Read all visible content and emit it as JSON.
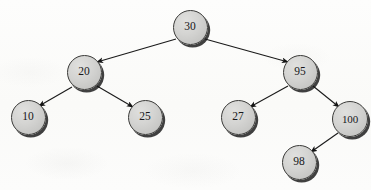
{
  "figure": {
    "clipped_caption_text": "",
    "background_color": "#fbfbf9",
    "node_fill_color": "#d4d4d2",
    "node_stroke_color": "#3a3a38",
    "node_shadow_color": "#121212",
    "edge_color": "#1a1a1a",
    "label_color": "#17171a"
  },
  "tree": {
    "nodes": [
      {
        "id": "n30",
        "label": "30",
        "cx": 190,
        "cy": 27,
        "r": 17.5
      },
      {
        "id": "n20",
        "label": "20",
        "cx": 84,
        "cy": 72,
        "r": 17.5
      },
      {
        "id": "n95",
        "label": "95",
        "cx": 300,
        "cy": 72,
        "r": 17.5
      },
      {
        "id": "n10",
        "label": "10",
        "cx": 28,
        "cy": 117,
        "r": 17.5
      },
      {
        "id": "n25",
        "label": "25",
        "cx": 145,
        "cy": 117,
        "r": 17.5
      },
      {
        "id": "n27",
        "label": "27",
        "cx": 238,
        "cy": 117,
        "r": 17.5
      },
      {
        "id": "n100",
        "label": "100",
        "cx": 350,
        "cy": 119,
        "r": 18.0
      },
      {
        "id": "n98",
        "label": "98",
        "cx": 299,
        "cy": 162,
        "r": 17.5
      }
    ],
    "edges": [
      {
        "from": "n30",
        "to": "n20",
        "x1": 176,
        "y1": 39,
        "x2": 97,
        "y2": 62
      },
      {
        "from": "n30",
        "to": "n95",
        "x1": 205,
        "y1": 39,
        "x2": 288,
        "y2": 62
      },
      {
        "from": "n20",
        "to": "n10",
        "x1": 72,
        "y1": 87,
        "x2": 39,
        "y2": 106
      },
      {
        "from": "n20",
        "to": "n25",
        "x1": 97,
        "y1": 86,
        "x2": 133,
        "y2": 107
      },
      {
        "from": "n95",
        "to": "n27",
        "x1": 288,
        "y1": 86,
        "x2": 250,
        "y2": 107
      },
      {
        "from": "n95",
        "to": "n100",
        "x1": 313,
        "y1": 86,
        "x2": 339,
        "y2": 107
      },
      {
        "from": "n100",
        "to": "n98",
        "x1": 338,
        "y1": 133,
        "x2": 311,
        "y2": 152
      }
    ]
  }
}
